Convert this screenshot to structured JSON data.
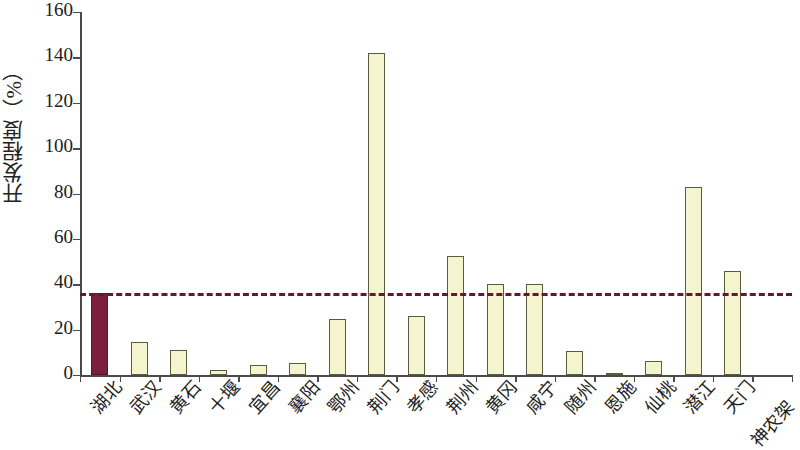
{
  "chart_data": {
    "type": "bar",
    "title": "",
    "xlabel": "",
    "ylabel": "开发程度（%）",
    "ylim": [
      0,
      160
    ],
    "ytick_labels": [
      "160",
      "140",
      "120",
      "100",
      "80",
      "60",
      "40",
      "20",
      "0"
    ],
    "ytick_values": [
      160,
      140,
      120,
      100,
      80,
      60,
      40,
      20,
      0
    ],
    "ytick_step": 20,
    "grid": false,
    "legend": null,
    "categories": [
      "湖北",
      "武汉",
      "黄石",
      "十堰",
      "宜昌",
      "襄阳",
      "鄂州",
      "荆门",
      "孝感",
      "荆州",
      "黄冈",
      "咸宁",
      "随州",
      "恩施",
      "仙桃",
      "潜江",
      "天门",
      "神农架"
    ],
    "values": [
      36,
      14.5,
      11,
      2,
      4.5,
      5.5,
      24.5,
      142,
      26,
      52.5,
      40,
      40,
      10.5,
      1,
      6,
      83,
      46,
      0
    ],
    "highlight_index": 0,
    "bar_color": "#f4f4ce",
    "bar_border_color": "#5c5c3d",
    "highlight_color": "#7b1f3c",
    "reference_line": {
      "value": 36,
      "style": "dashed",
      "color": "#5d1b31"
    },
    "axis_color": "#4a4a4a",
    "background": "#ffffff"
  }
}
